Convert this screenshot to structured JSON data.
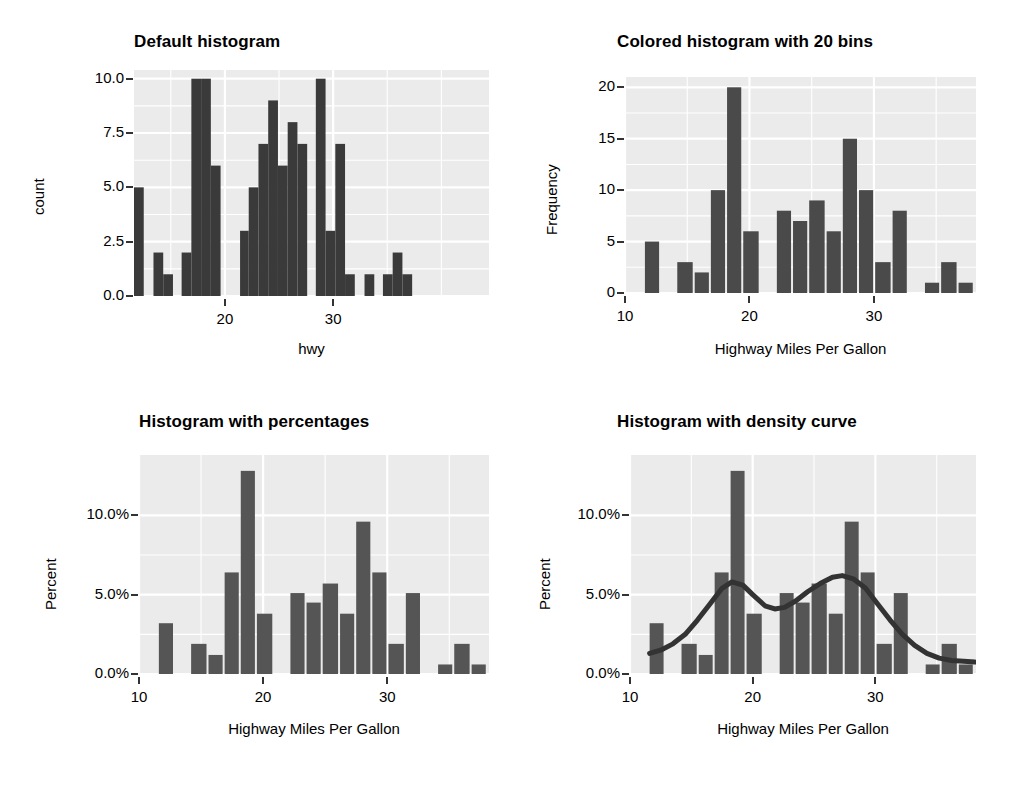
{
  "figure": {
    "background": "#ffffff",
    "panel_background": "#ebebeb",
    "gridline_color": "#ffffff",
    "tick_color": "#333333",
    "layout": "2x2 grid of histograms"
  },
  "chart_data": [
    {
      "id": "default-histogram",
      "type": "bar",
      "title": "Default histogram",
      "xlabel": "hwy",
      "ylabel": "count",
      "bar_color": "#3a3a3a",
      "bins": 30,
      "xlim": [
        11.6,
        44.4
      ],
      "ylim": [
        0,
        10.4
      ],
      "xticks": [
        20,
        30
      ],
      "xticklabels": [
        "20",
        "30"
      ],
      "yticks": [
        0.0,
        2.5,
        5.0,
        7.5,
        10.0
      ],
      "yticklabels": [
        "0.0",
        "2.5",
        "5.0",
        "7.5",
        "10.0"
      ],
      "grid": true,
      "legend": "none",
      "bin_edges": [
        11.6,
        12.5,
        13.4,
        14.3,
        15.2,
        16.0,
        16.9,
        17.8,
        18.7,
        19.6,
        20.5,
        21.4,
        22.2,
        23.1,
        24.0,
        24.9,
        25.8,
        26.7,
        27.6,
        28.4,
        29.3,
        30.2,
        31.1,
        32.0,
        32.9,
        33.8,
        34.6,
        35.5,
        36.4,
        37.3,
        38.2
      ],
      "values": [
        5,
        0,
        2,
        1,
        0,
        2,
        10,
        10,
        6,
        0,
        0,
        3,
        5,
        7,
        9,
        6,
        8,
        7,
        0,
        10,
        3,
        7,
        1,
        0,
        1,
        0,
        1,
        2,
        1,
        0
      ]
    },
    {
      "id": "colored-histogram-20-bins",
      "type": "bar",
      "title": "Colored histogram with 20 bins",
      "xlabel": "Highway Miles Per Gallon",
      "ylabel": "Frequency",
      "bar_color": "#4a4a4a",
      "bins": 20,
      "xlim": [
        10.0,
        38.2
      ],
      "ylim": [
        0,
        21
      ],
      "xticks": [
        10,
        20,
        30
      ],
      "xticklabels": [
        "10",
        "20",
        "30"
      ],
      "yticks": [
        0,
        5,
        10,
        15,
        20
      ],
      "yticklabels": [
        "0",
        "5",
        "10",
        "15",
        "20"
      ],
      "grid": true,
      "legend": "none",
      "bin_edges": [
        11.6,
        12.9,
        14.2,
        15.6,
        16.9,
        18.2,
        19.5,
        20.9,
        22.2,
        23.5,
        24.8,
        26.2,
        27.5,
        28.8,
        30.1,
        31.5,
        32.8,
        34.1,
        35.4,
        36.8,
        38.1
      ],
      "values": [
        5,
        0,
        3,
        2,
        10,
        20,
        6,
        0,
        8,
        7,
        9,
        6,
        15,
        10,
        3,
        8,
        0,
        1,
        3,
        1
      ]
    },
    {
      "id": "histogram-with-percentages",
      "type": "bar",
      "title": "Histogram with percentages",
      "xlabel": "Highway Miles Per Gallon",
      "ylabel": "Percent",
      "bar_color": "#555555",
      "bins": 20,
      "xlim": [
        10.0,
        38.2
      ],
      "ylim": [
        0,
        13.8
      ],
      "xticks": [
        10,
        20,
        30
      ],
      "xticklabels": [
        "10",
        "20",
        "30"
      ],
      "yticks": [
        0.0,
        5.0,
        10.0
      ],
      "yticklabels": [
        "0.0%",
        "5.0%",
        "10.0%"
      ],
      "grid": true,
      "legend": "none",
      "bin_edges": [
        11.6,
        12.9,
        14.2,
        15.6,
        16.9,
        18.2,
        19.5,
        20.9,
        22.2,
        23.5,
        24.8,
        26.2,
        27.5,
        28.8,
        30.1,
        31.5,
        32.8,
        34.1,
        35.4,
        36.8,
        38.1
      ],
      "values": [
        3.2,
        0,
        1.9,
        1.2,
        6.4,
        12.8,
        3.8,
        0,
        5.1,
        4.5,
        5.7,
        3.8,
        9.6,
        6.4,
        1.9,
        5.1,
        0,
        0.6,
        1.9,
        0.6
      ]
    },
    {
      "id": "histogram-with-density-curve",
      "type": "bar",
      "title": "Histogram with density curve",
      "xlabel": "Highway Miles Per Gallon",
      "ylabel": "Percent",
      "bar_color": "#555555",
      "curve_color": "#333333",
      "bins": 20,
      "xlim": [
        10.0,
        38.2
      ],
      "ylim": [
        0,
        13.8
      ],
      "xticks": [
        10,
        20,
        30
      ],
      "xticklabels": [
        "10",
        "20",
        "30"
      ],
      "yticks": [
        0.0,
        5.0,
        10.0
      ],
      "yticklabels": [
        "0.0%",
        "5.0%",
        "10.0%"
      ],
      "grid": true,
      "legend": "none",
      "overlay": "density curve",
      "bin_edges": [
        11.6,
        12.9,
        14.2,
        15.6,
        16.9,
        18.2,
        19.5,
        20.9,
        22.2,
        23.5,
        24.8,
        26.2,
        27.5,
        28.8,
        30.1,
        31.5,
        32.8,
        34.1,
        35.4,
        36.8,
        38.1
      ],
      "values": [
        3.2,
        0,
        1.9,
        1.2,
        6.4,
        12.8,
        3.8,
        0,
        5.1,
        4.5,
        5.7,
        3.8,
        9.6,
        6.4,
        1.9,
        5.1,
        0,
        0.6,
        1.9,
        0.6
      ],
      "density_x": [
        11.6,
        12.5,
        13.5,
        14.5,
        15.5,
        16.5,
        17.5,
        18.3,
        19.2,
        20.0,
        21.0,
        21.8,
        22.6,
        23.5,
        24.5,
        25.5,
        26.5,
        27.3,
        28.2,
        29.2,
        30.2,
        31.2,
        32.2,
        33.2,
        34.2,
        35.2,
        36.2,
        37.2,
        38.1
      ],
      "density_y": [
        1.3,
        1.5,
        1.9,
        2.5,
        3.4,
        4.4,
        5.4,
        5.8,
        5.6,
        5.0,
        4.3,
        4.1,
        4.2,
        4.6,
        5.2,
        5.7,
        6.1,
        6.2,
        6.0,
        5.4,
        4.4,
        3.4,
        2.5,
        1.8,
        1.3,
        1.0,
        0.85,
        0.8,
        0.75
      ]
    }
  ]
}
